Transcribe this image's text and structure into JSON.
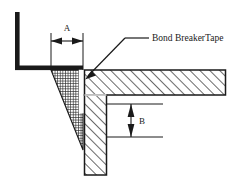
{
  "diagram": {
    "type": "construction-detail-section",
    "background_color": "#ffffff",
    "line_color": "#1a1a1a",
    "annotations": {
      "dimension_a": {
        "label": "A",
        "orientation": "horizontal",
        "name": "joint-width-dimension"
      },
      "dimension_b": {
        "label": "B",
        "orientation": "vertical",
        "name": "joint-depth-dimension"
      },
      "note_tape": {
        "label": "Bond BreakerTape",
        "name": "bond-breaker-tape-callout"
      }
    },
    "components": {
      "angle_bracket": {
        "name": "steel-angle-bracket",
        "fill": "#1a1a1a"
      },
      "sealant": {
        "name": "sealant-joint-filler",
        "fill": "crosshatch-fine",
        "color": "#2b2b2b"
      },
      "concrete_slab": {
        "name": "concrete-slab",
        "fill": "diagonal-hatch",
        "color": "#1a1a1a"
      },
      "concrete_column": {
        "name": "concrete-column",
        "fill": "diagonal-hatch",
        "color": "#1a1a1a"
      },
      "bond_breaker_tape": {
        "name": "bond-breaker-tape-strip",
        "fill": "#ffffff"
      }
    }
  }
}
